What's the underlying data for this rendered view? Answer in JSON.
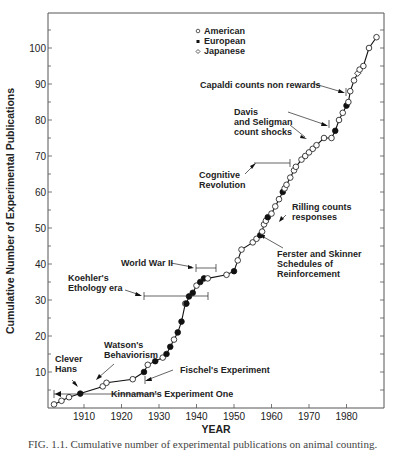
{
  "chart_data": {
    "type": "line",
    "title": "",
    "xlabel": "YEAR",
    "ylabel": "Cumulative Number of Experimental Publications",
    "xlim": [
      1900,
      1990
    ],
    "ylim": [
      0,
      108
    ],
    "x_ticks": [
      1910,
      1920,
      1930,
      1940,
      1950,
      1960,
      1970,
      1980
    ],
    "y_ticks": [
      10,
      20,
      30,
      40,
      50,
      60,
      70,
      80,
      90,
      100
    ],
    "grid": false,
    "legend": {
      "position": "top-center",
      "entries": [
        {
          "label": "American",
          "marker": "open-circle"
        },
        {
          "label": "European",
          "marker": "filled-circle"
        },
        {
          "label": "Japanese",
          "marker": "open-diamond"
        }
      ]
    },
    "points": [
      {
        "x": 1902,
        "y": 1,
        "origin": "American"
      },
      {
        "x": 1904,
        "y": 2,
        "origin": "American"
      },
      {
        "x": 1906,
        "y": 3,
        "origin": "American"
      },
      {
        "x": 1909,
        "y": 4,
        "origin": "European"
      },
      {
        "x": 1915,
        "y": 6,
        "origin": "American"
      },
      {
        "x": 1916,
        "y": 7,
        "origin": "American"
      },
      {
        "x": 1923,
        "y": 8,
        "origin": "American"
      },
      {
        "x": 1926,
        "y": 10,
        "origin": "European"
      },
      {
        "x": 1927,
        "y": 12,
        "origin": "American"
      },
      {
        "x": 1929,
        "y": 13,
        "origin": "European"
      },
      {
        "x": 1931,
        "y": 14,
        "origin": "American"
      },
      {
        "x": 1932,
        "y": 15,
        "origin": "European"
      },
      {
        "x": 1933,
        "y": 17,
        "origin": "European"
      },
      {
        "x": 1934,
        "y": 19,
        "origin": "American"
      },
      {
        "x": 1935,
        "y": 21,
        "origin": "European"
      },
      {
        "x": 1936,
        "y": 24,
        "origin": "European"
      },
      {
        "x": 1937,
        "y": 29,
        "origin": "American"
      },
      {
        "x": 1937.3,
        "y": 29,
        "origin": "European"
      },
      {
        "x": 1938,
        "y": 31,
        "origin": "European"
      },
      {
        "x": 1939,
        "y": 32,
        "origin": "European"
      },
      {
        "x": 1940,
        "y": 34,
        "origin": "American"
      },
      {
        "x": 1941,
        "y": 35,
        "origin": "European"
      },
      {
        "x": 1942,
        "y": 36,
        "origin": "European"
      },
      {
        "x": 1943,
        "y": 36,
        "origin": "American"
      },
      {
        "x": 1948,
        "y": 37,
        "origin": "American"
      },
      {
        "x": 1950,
        "y": 38,
        "origin": "European"
      },
      {
        "x": 1951,
        "y": 41,
        "origin": "American"
      },
      {
        "x": 1952,
        "y": 44,
        "origin": "American"
      },
      {
        "x": 1955,
        "y": 46,
        "origin": "American"
      },
      {
        "x": 1956,
        "y": 47,
        "origin": "American"
      },
      {
        "x": 1957,
        "y": 48,
        "origin": "European"
      },
      {
        "x": 1957.5,
        "y": 49,
        "origin": "American"
      },
      {
        "x": 1958,
        "y": 51,
        "origin": "American"
      },
      {
        "x": 1958.5,
        "y": 52,
        "origin": "American"
      },
      {
        "x": 1959,
        "y": 53,
        "origin": "European"
      },
      {
        "x": 1960,
        "y": 54,
        "origin": "American"
      },
      {
        "x": 1961,
        "y": 56,
        "origin": "American"
      },
      {
        "x": 1962,
        "y": 58,
        "origin": "American"
      },
      {
        "x": 1963,
        "y": 60,
        "origin": "European"
      },
      {
        "x": 1963.5,
        "y": 61,
        "origin": "American"
      },
      {
        "x": 1964,
        "y": 62,
        "origin": "American"
      },
      {
        "x": 1965,
        "y": 64,
        "origin": "American"
      },
      {
        "x": 1966,
        "y": 66,
        "origin": "American"
      },
      {
        "x": 1966.5,
        "y": 67,
        "origin": "American"
      },
      {
        "x": 1968,
        "y": 69,
        "origin": "American"
      },
      {
        "x": 1969,
        "y": 70,
        "origin": "American"
      },
      {
        "x": 1970,
        "y": 71,
        "origin": "American"
      },
      {
        "x": 1971,
        "y": 72,
        "origin": "American"
      },
      {
        "x": 1972,
        "y": 73,
        "origin": "American"
      },
      {
        "x": 1974,
        "y": 75,
        "origin": "American"
      },
      {
        "x": 1976,
        "y": 75,
        "origin": "American"
      },
      {
        "x": 1977,
        "y": 77,
        "origin": "European"
      },
      {
        "x": 1978,
        "y": 80,
        "origin": "American"
      },
      {
        "x": 1979,
        "y": 82,
        "origin": "American"
      },
      {
        "x": 1980,
        "y": 84,
        "origin": "European"
      },
      {
        "x": 1980.5,
        "y": 85,
        "origin": "American"
      },
      {
        "x": 1981,
        "y": 88,
        "origin": "American"
      },
      {
        "x": 1982,
        "y": 91,
        "origin": "American"
      },
      {
        "x": 1983,
        "y": 93,
        "origin": "Japanese"
      },
      {
        "x": 1983.5,
        "y": 94,
        "origin": "American"
      },
      {
        "x": 1984.5,
        "y": 95,
        "origin": "American"
      },
      {
        "x": 1986,
        "y": 100,
        "origin": "American"
      },
      {
        "x": 1988,
        "y": 103,
        "origin": "American"
      }
    ],
    "annotations": [
      {
        "text": "Clever Hans",
        "year": 1909,
        "kind": "arrow"
      },
      {
        "text": "Watson's Behaviorism",
        "year": 1913,
        "kind": "arrow"
      },
      {
        "text": "Kinnaman's Experiment One",
        "year": 1902,
        "kind": "range",
        "range": [
          1902,
          1909
        ]
      },
      {
        "text": "Fischel's Experiment",
        "year": 1926,
        "kind": "arrow"
      },
      {
        "text": "Koehler's Ethology era",
        "kind": "range",
        "range": [
          1926,
          1943
        ]
      },
      {
        "text": "World War II",
        "kind": "range",
        "range": [
          1939,
          1945
        ]
      },
      {
        "text": "Ferster and Skinner Schedules of Reinforcement",
        "year": 1957,
        "kind": "arrow"
      },
      {
        "text": "Rilling counts responses",
        "year": 1962,
        "kind": "arrow"
      },
      {
        "text": "Cognitive Revolution",
        "kind": "range",
        "range": [
          1955,
          1965
        ]
      },
      {
        "text": "Davis and Seligman count shocks",
        "year": 1967,
        "kind": "arrow"
      },
      {
        "text": "Capaldi counts non rewards",
        "year": 1979,
        "kind": "arrow"
      }
    ]
  },
  "labels": {
    "legend": [
      "American",
      "European",
      "Japanese"
    ],
    "x_ticks": [
      "1910",
      "1920",
      "1930",
      "1940",
      "1950",
      "1960",
      "1970",
      "1980"
    ],
    "y_ticks": [
      "10",
      "20",
      "30",
      "40",
      "50",
      "60",
      "70",
      "80",
      "90",
      "100"
    ],
    "xlabel": "YEAR",
    "ylabel": "Cumulative Number of Experimental Publications",
    "annotations": {
      "capaldi": "Capaldi counts non rewards",
      "davis_1": "Davis",
      "davis_2": "and Seligman",
      "davis_3": "count shocks",
      "cognitive_1": "Cognitive",
      "cognitive_2": "Revolution",
      "rilling_1": "Rilling counts",
      "rilling_2": "responses",
      "ferster_1": "Ferster and Skinner",
      "ferster_2": "Schedules of",
      "ferster_3": "Reinforcement",
      "wwii": "World War II",
      "koehler_1": "Koehler's",
      "koehler_2": "Ethology era",
      "watson_1": "Watson's",
      "watson_2": "Behaviorism",
      "clever_1": "Clever",
      "clever_2": "Hans",
      "fischel": "Fischel's Experiment",
      "kinnaman": "Kinnaman's Experiment One"
    },
    "caption": "FIG. 1.1.  Cumulative number of experimental publications on animal counting."
  }
}
